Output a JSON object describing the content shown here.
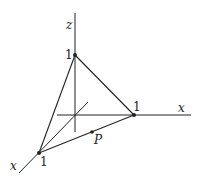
{
  "diagram": {
    "type": "3d-coordinate-plane-tetrahedron",
    "axes": {
      "vertical_label": "z",
      "horizontal_label": "x",
      "diagonal_label": "x"
    },
    "vertices": {
      "top": "1",
      "right": "1",
      "front": "1"
    },
    "point": {
      "label": "P"
    },
    "colors": {
      "line": "#222222",
      "background": "#ffffff"
    }
  }
}
